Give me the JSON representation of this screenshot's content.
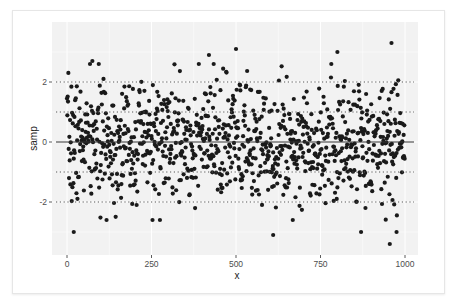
{
  "chart_data": {
    "type": "scatter",
    "title": "",
    "xlabel": "x",
    "ylabel": "samp",
    "xlim": [
      -30,
      1030
    ],
    "ylim": [
      -3.4,
      3.6
    ],
    "x_ticks": [
      0,
      250,
      500,
      750,
      1000
    ],
    "x_tick_labels": [
      "0",
      "250",
      "500",
      "750",
      "1000"
    ],
    "y_ticks": [
      -2,
      0,
      2
    ],
    "y_tick_labels": [
      "-2",
      "0",
      "2"
    ],
    "grid": true,
    "legend": "none",
    "n_points": 1000,
    "distribution": "standard normal samples (mean ~0, sd ~1)",
    "reference_lines": [
      {
        "y": 0,
        "style": "solid",
        "label": "mean"
      },
      {
        "y": 1,
        "style": "dotted"
      },
      {
        "y": -1,
        "style": "dotted"
      },
      {
        "y": 2,
        "style": "dotted"
      },
      {
        "y": -2,
        "style": "dotted"
      }
    ],
    "notable_points": [
      {
        "x": 20,
        "y": -3.0
      },
      {
        "x": 75,
        "y": 2.7
      },
      {
        "x": 420,
        "y": 2.9
      },
      {
        "x": 500,
        "y": 3.1
      },
      {
        "x": 610,
        "y": -3.1
      },
      {
        "x": 800,
        "y": 3.0
      },
      {
        "x": 870,
        "y": -3.0
      },
      {
        "x": 955,
        "y": -3.4
      },
      {
        "x": 960,
        "y": 3.3
      },
      {
        "x": 975,
        "y": -3.0
      }
    ],
    "seed": 7
  },
  "axes": {
    "x_title": "x",
    "y_title": "samp",
    "x_ticks": [
      "0",
      "250",
      "500",
      "750",
      "1000"
    ],
    "y_ticks": [
      "-2",
      "0",
      "2"
    ]
  },
  "colors": {
    "panel_bg": "#f2f2f2",
    "grid": "#ffffff",
    "points": "#1a1a1a",
    "mean_line": "#333333",
    "dotted_line": "#555555"
  }
}
